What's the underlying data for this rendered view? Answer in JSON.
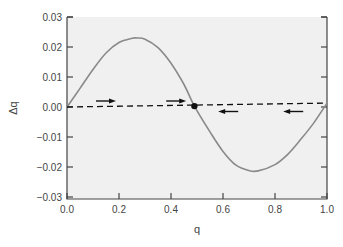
{
  "chart_data": {
    "type": "line",
    "title": "",
    "xlabel": "q",
    "ylabel": "Δq",
    "xlim": [
      0.0,
      1.0
    ],
    "ylim": [
      -0.03,
      0.03
    ],
    "x_ticks": [
      "0.0",
      "0.2",
      "0.4",
      "0.6",
      "0.8",
      "1.0"
    ],
    "y_ticks": [
      "0.03",
      "0.02",
      "0.01",
      "0.00",
      "−0.01",
      "−0.02",
      "−0.03"
    ],
    "grid": false,
    "legend": null,
    "series": [
      {
        "name": "Δq curve",
        "style": "solid",
        "color": "#8a8a8a",
        "x": [
          0.0,
          0.05,
          0.1,
          0.15,
          0.2,
          0.25,
          0.27,
          0.3,
          0.35,
          0.4,
          0.45,
          0.49,
          0.55,
          0.6,
          0.65,
          0.7,
          0.735,
          0.8,
          0.85,
          0.9,
          0.95,
          1.0
        ],
        "y": [
          0.0,
          0.0062,
          0.0125,
          0.018,
          0.0215,
          0.0229,
          0.023,
          0.0226,
          0.0198,
          0.0146,
          0.0075,
          0.0003,
          -0.0083,
          -0.0148,
          -0.0194,
          -0.0212,
          -0.0213,
          -0.0192,
          -0.0157,
          -0.0107,
          -0.0052,
          0.0013
        ]
      },
      {
        "name": "Δq = 0 reference",
        "style": "dashed",
        "color": "#111111",
        "x": [
          0.0,
          1.0
        ],
        "y": [
          0.0,
          0.0013
        ]
      }
    ],
    "annotations": [
      {
        "type": "arrow",
        "direction": "right",
        "x": 0.15,
        "y": 0.002
      },
      {
        "type": "arrow",
        "direction": "right",
        "x": 0.42,
        "y": 0.002
      },
      {
        "type": "arrow",
        "direction": "left",
        "x": 0.62,
        "y": -0.0015
      },
      {
        "type": "arrow",
        "direction": "left",
        "x": 0.87,
        "y": -0.0015
      },
      {
        "type": "point",
        "label": "equilibrium",
        "x": 0.49,
        "y": 0.0003
      }
    ]
  },
  "colors": {
    "plot_bg": "#f0f0f0",
    "axis": "#444444",
    "curve": "#8a8a8a",
    "dashed": "#111111"
  }
}
